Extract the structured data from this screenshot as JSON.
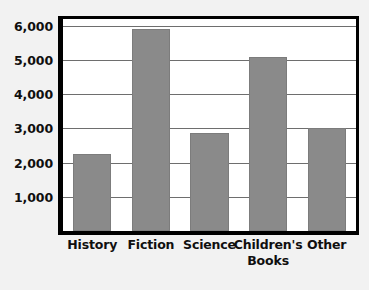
{
  "chart_data": {
    "type": "bar",
    "title": "",
    "subtitle": "",
    "xlabel": "",
    "ylabel": "",
    "categories": [
      "History",
      "Fiction",
      "Science",
      "Children's Books",
      "Other"
    ],
    "values": [
      2250,
      5900,
      2875,
      5100,
      3000
    ],
    "series": [
      {
        "name": "",
        "values": [
          2250,
          5900,
          2875,
          5100,
          3000
        ]
      }
    ],
    "ylim": [
      0,
      6200
    ],
    "y_tick_labels": [
      "1,000",
      "2,000",
      "3,000",
      "4,000",
      "5,000",
      "6,000"
    ],
    "y_tick_values": [
      1000,
      2000,
      3000,
      4000,
      5000,
      6000
    ],
    "grid": true,
    "grid_axis": "y",
    "legend": false,
    "legend_position": "none",
    "annotations": [],
    "colors": {
      "bar_fill": "#8a8a8a",
      "bar_stroke": "#7c7c7c",
      "plot_background": "#ffffff",
      "page_background": "#f2f2f2",
      "axis": "#000000",
      "gridline": "#6e6e6e",
      "text": "#100f0f"
    }
  }
}
